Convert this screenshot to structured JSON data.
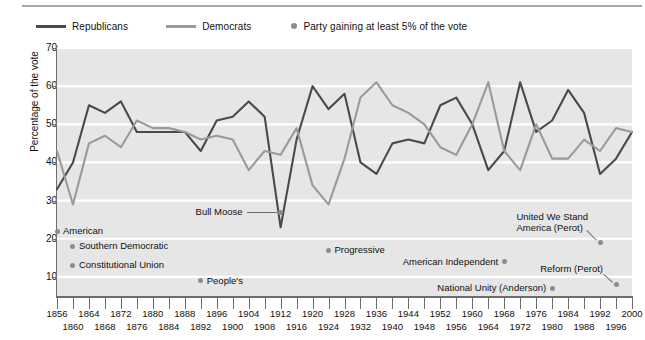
{
  "legend": {
    "items": [
      {
        "label": "Republicans",
        "type": "line",
        "color": "#4a4a4a"
      },
      {
        "label": "Democrats",
        "type": "line",
        "color": "#9a9a9a"
      },
      {
        "label": "Party gaining at least 5% of the vote",
        "type": "dot",
        "color": "#8c8c8c"
      }
    ]
  },
  "chart_data": {
    "type": "line",
    "title": "",
    "xlabel": "",
    "ylabel": "Percentage of the vote",
    "xlim": [
      1856,
      2000
    ],
    "ylim": [
      5,
      70
    ],
    "yticks": [
      10,
      20,
      30,
      40,
      50,
      60,
      70
    ],
    "grid": true,
    "legend_position": "top-left",
    "x": [
      1856,
      1860,
      1864,
      1868,
      1872,
      1876,
      1880,
      1884,
      1888,
      1892,
      1896,
      1900,
      1904,
      1908,
      1912,
      1916,
      1920,
      1924,
      1928,
      1932,
      1936,
      1940,
      1944,
      1948,
      1952,
      1956,
      1960,
      1964,
      1968,
      1972,
      1976,
      1980,
      1984,
      1988,
      1992,
      1996,
      2000
    ],
    "series": [
      {
        "name": "Republicans",
        "color": "#4a4a4a",
        "values": [
          33,
          40,
          55,
          53,
          56,
          48,
          48,
          48,
          48,
          43,
          51,
          52,
          56,
          52,
          23,
          46,
          60,
          54,
          58,
          40,
          37,
          45,
          46,
          45,
          55,
          57,
          50,
          38,
          43,
          61,
          48,
          51,
          59,
          53,
          37,
          41,
          48
        ]
      },
      {
        "name": "Democrats",
        "color": "#9a9a9a",
        "values": [
          43,
          29,
          45,
          47,
          44,
          51,
          49,
          49,
          48,
          46,
          47,
          46,
          38,
          43,
          42,
          49,
          34,
          29,
          41,
          57,
          61,
          55,
          53,
          50,
          44,
          42,
          50,
          61,
          43,
          38,
          50,
          41,
          41,
          46,
          43,
          49,
          48
        ]
      }
    ],
    "third_party_points": [
      {
        "label": "American",
        "year": 1856,
        "value": 22,
        "label_side": "right"
      },
      {
        "label": "Southern Democratic",
        "year": 1860,
        "value": 18,
        "label_side": "right"
      },
      {
        "label": "Constitutional Union",
        "year": 1860,
        "value": 13,
        "label_side": "right"
      },
      {
        "label": "People's",
        "year": 1892,
        "value": 9,
        "label_side": "right"
      },
      {
        "label": "Bull Moose",
        "year": 1912,
        "value": 27,
        "label_side": "left"
      },
      {
        "label": "Progressive",
        "year": 1924,
        "value": 17,
        "label_side": "right"
      },
      {
        "label": "American Independent",
        "year": 1968,
        "value": 14,
        "label_side": "left"
      },
      {
        "label": "National Unity (Anderson)",
        "year": 1980,
        "value": 7,
        "label_side": "left"
      },
      {
        "label": "United We Stand America (Perot)",
        "year": 1992,
        "value": 19,
        "label_side": "above"
      },
      {
        "label": "Reform (Perot)",
        "year": 1996,
        "value": 8,
        "label_side": "above"
      }
    ]
  },
  "xaxis": {
    "row1": [
      1856,
      1864,
      1872,
      1880,
      1888,
      1896,
      1904,
      1912,
      1920,
      1928,
      1936,
      1944,
      1952,
      1960,
      1968,
      1976,
      1984,
      1992,
      2000
    ],
    "row2": [
      1860,
      1868,
      1876,
      1884,
      1892,
      1900,
      1908,
      1916,
      1924,
      1932,
      1940,
      1948,
      1956,
      1964,
      1972,
      1980,
      1988,
      1996
    ]
  },
  "colors": {
    "plot_background": "#e6e6e6",
    "gridline": "#ffffff",
    "axis": "#6d6d6d",
    "republican": "#4a4a4a",
    "democrat": "#9a9a9a",
    "third_party_dot": "#8c8c8c",
    "text": "#111111"
  }
}
